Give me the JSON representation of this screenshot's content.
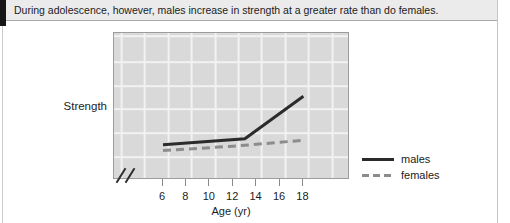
{
  "caption_bar": {
    "text": "During adolescence, however, males increase in strength at a greater rate than do females."
  },
  "chart_data": {
    "type": "line",
    "title": "",
    "xlabel": "Age (yr)",
    "ylabel": "Strength",
    "x_ticks": [
      6,
      8,
      10,
      12,
      14,
      16,
      18
    ],
    "xlim": [
      4.5,
      19
    ],
    "ylim": [
      0,
      100
    ],
    "y_tick_labels": [],
    "grid": true,
    "x_axis_break": true,
    "legend_position": "right-of-plot",
    "series": [
      {
        "name": "males",
        "line_style": "solid",
        "color": "#2b2b2b",
        "points": [
          {
            "age": 6,
            "strength": 24
          },
          {
            "age": 13,
            "strength": 28
          },
          {
            "age": 18,
            "strength": 57
          }
        ]
      },
      {
        "name": "females",
        "line_style": "dashed",
        "color": "#8c8c8c",
        "points": [
          {
            "age": 6,
            "strength": 20
          },
          {
            "age": 12,
            "strength": 23
          },
          {
            "age": 18,
            "strength": 27
          }
        ]
      }
    ],
    "note": "Strength axis is qualitative (no numeric tick labels); strength values are relative 0-100 estimates read from the figure"
  },
  "colors": {
    "caption_bg": "#ebebeb",
    "plot_bg": "#d9d9d9",
    "gridline": "#f2f2f2",
    "males_line": "#2b2b2b",
    "females_line": "#8c8c8c"
  }
}
